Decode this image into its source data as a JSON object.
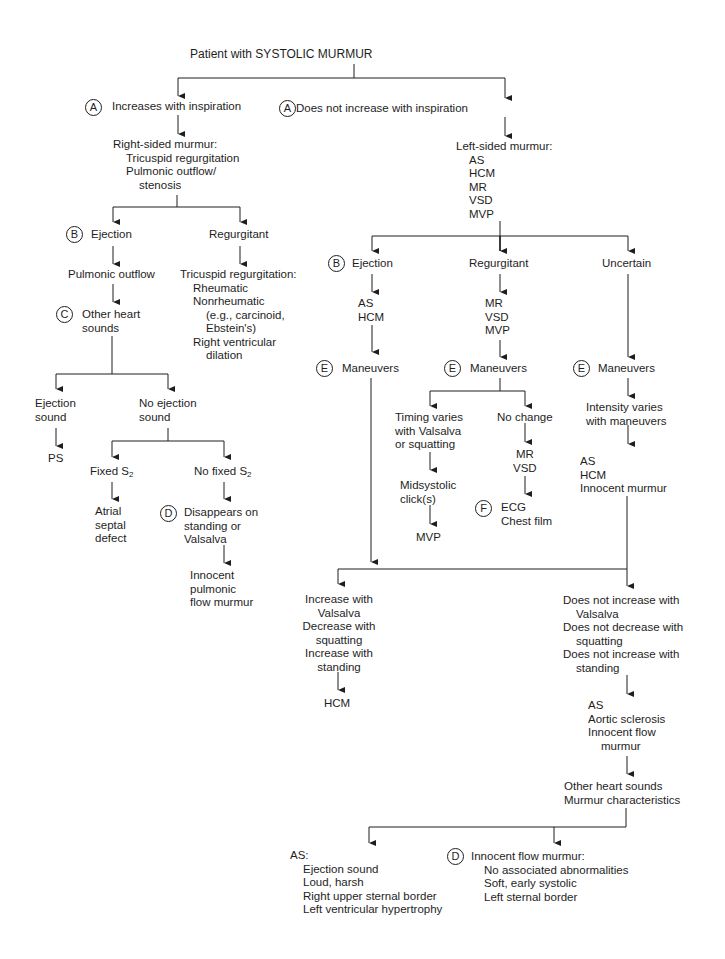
{
  "title": "Patient with SYSTOLIC MURMUR",
  "badges": {
    "A": "A",
    "B": "B",
    "C": "C",
    "D": "D",
    "E": "E",
    "F": "F"
  },
  "right_branch": {
    "entry": "Increases with inspiration",
    "murmur_title": "Right-sided murmur:",
    "murmur_items": [
      "Tricuspid regurgitation",
      "Pulmonic outflow/",
      "stenosis"
    ],
    "ejection": "Ejection",
    "regurgitant": "Regurgitant",
    "pulmonic_outflow": "Pulmonic outflow",
    "tr_title": "Tricuspid regurgitation:",
    "tr_items": [
      "Rheumatic",
      "Nonrheumatic",
      "(e.g., carcinoid,",
      "Ebstein's)",
      "Right ventricular",
      "dilation"
    ],
    "other_heart_sounds": [
      "Other heart",
      "sounds"
    ],
    "ejection_sound": [
      "Ejection",
      "sound"
    ],
    "no_ejection_sound": [
      "No ejection",
      "sound"
    ],
    "ps": "PS",
    "fixed_s2": "Fixed S",
    "no_fixed_s2": "No fixed S",
    "s2_sub": "2",
    "asd": [
      "Atrial",
      "septal",
      "defect"
    ],
    "disappears": [
      "Disappears on",
      "standing or",
      "Valsalva"
    ],
    "innocent_pulmonic": [
      "Innocent",
      "pulmonic",
      "flow murmur"
    ]
  },
  "left_branch": {
    "entry": "Does not increase with inspiration",
    "murmur_title": "Left-sided murmur:",
    "murmur_items": [
      "AS",
      "HCM",
      "MR",
      "VSD",
      "MVP"
    ],
    "ejection": "Ejection",
    "regurgitant": "Regurgitant",
    "uncertain": "Uncertain",
    "ejection_dx": [
      "AS",
      "HCM"
    ],
    "regurgitant_dx": [
      "MR",
      "VSD",
      "MVP"
    ],
    "maneuvers": "Maneuvers",
    "timing_varies": [
      "Timing varies",
      "with Valsalva",
      "or squatting"
    ],
    "no_change": "No change",
    "midsystolic": [
      "Midsystolic",
      "click(s)"
    ],
    "mvp": "MVP",
    "mr_vsd": [
      "MR",
      "VSD"
    ],
    "ecg": [
      "ECG",
      "Chest film"
    ],
    "intensity_varies": [
      "Intensity varies",
      "with maneuvers"
    ],
    "uncertain_dx": [
      "AS",
      "HCM",
      "Innocent murmur"
    ],
    "increase_with": [
      "Increase with",
      "Valsalva",
      "Decrease with",
      "squatting",
      "Increase with",
      "standing"
    ],
    "hcm": "HCM",
    "does_not": [
      "Does not increase with",
      "Valsalva",
      "Does not decrease with",
      "squatting",
      "Does not increase with",
      "standing"
    ],
    "as_group": [
      "AS",
      "Aortic sclerosis",
      "Innocent flow",
      "murmur"
    ],
    "other_sounds": [
      "Other heart sounds",
      "Murmur characteristics"
    ],
    "as_final_title": "AS:",
    "as_final_items": [
      "Ejection sound",
      "Loud, harsh",
      "Right upper sternal border",
      "Left ventricular hypertrophy"
    ],
    "innocent_final_title": "Innocent flow murmur:",
    "innocent_final_items": [
      "No associated abnormalities",
      "Soft, early systolic",
      "Left sternal border"
    ]
  }
}
